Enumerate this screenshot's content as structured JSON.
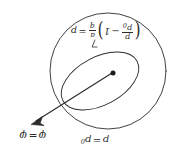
{
  "figure": {
    "orientation": "labels rotated 180 degrees (upside-down scan)",
    "background_color": "#ffffff",
    "stroke_color": "#2b2b2b"
  },
  "labels": {
    "formula": {
      "lhs": "p",
      "equals": "=",
      "paren_open": "(",
      "paren_close": ")",
      "minus": "−",
      "one": "1",
      "frac_pressure": {
        "num": "p",
        "den": "p",
        "den_sub": "0"
      },
      "frac_coeff": {
        "num": "a",
        "den": "q"
      },
      "plain": "p = (a/q)(p/p₀ − 1)"
    },
    "potential": {
      "symbol": "φ",
      "equals": "=",
      "value": "φ",
      "plain": "φ = φ"
    },
    "pressure": {
      "symbol": "p",
      "equals": "=",
      "value": "p",
      "value_sub": "0",
      "plain": "p = p₀"
    }
  },
  "geometry": {
    "outer_circle": {
      "cx": 108,
      "cy": 71,
      "r": 58,
      "name": "outer-circle"
    },
    "inner_ellipse": {
      "cx": 100,
      "cy": 81,
      "rx": 42,
      "ry": 24,
      "rotation_deg": -28,
      "name": "inner-ellipse"
    },
    "center_dot": {
      "cx": 113,
      "cy": 73,
      "r": 2.6,
      "name": "center-dot"
    },
    "arrow": {
      "x1": 113,
      "y1": 73,
      "x2": 31,
      "y2": 124,
      "name": "radius-arrow"
    },
    "leader_line": {
      "x1": 92,
      "y1": 41,
      "x2": 92,
      "y2": 48,
      "name": "formula-leader-line"
    }
  }
}
